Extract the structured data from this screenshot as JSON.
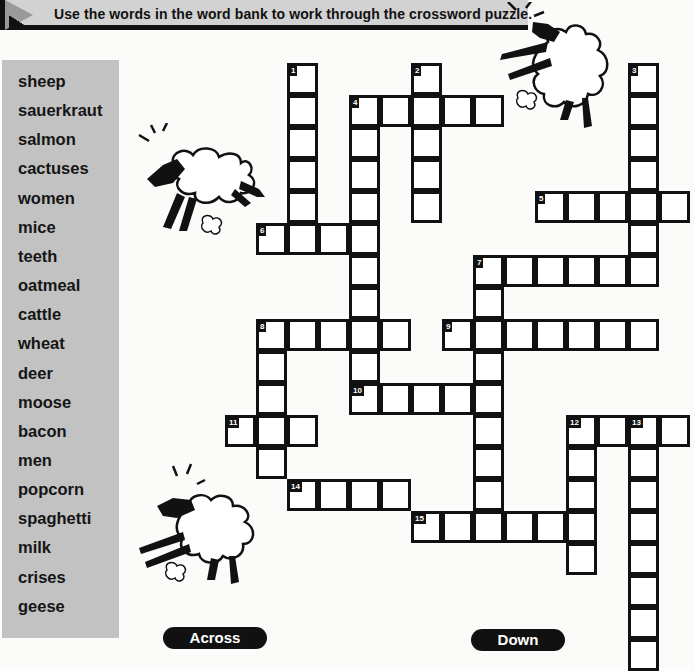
{
  "header": {
    "instruction": "Use the words in the word bank to work through the crossword puzzle."
  },
  "word_bank": {
    "words": [
      "sheep",
      "sauerkraut",
      "salmon",
      "cactuses",
      "women",
      "mice",
      "teeth",
      "oatmeal",
      "cattle",
      "wheat",
      "deer",
      "moose",
      "bacon",
      "men",
      "popcorn",
      "spaghetti",
      "milk",
      "crises",
      "geese"
    ]
  },
  "clue_headers": {
    "across": "Across",
    "down": "Down"
  },
  "crossword": {
    "grid_origin": {
      "x": 257,
      "y": 64,
      "cell_w": 31,
      "cell_h": 32
    },
    "entries": [
      {
        "number": "1",
        "direction": "down",
        "col": 1,
        "row": 0,
        "length": 6
      },
      {
        "number": "2",
        "direction": "down",
        "col": 5,
        "row": 0,
        "length": 5
      },
      {
        "number": "3",
        "direction": "down",
        "col": 12,
        "row": 0,
        "length": 7
      },
      {
        "number": "4",
        "direction": "across",
        "col": 3,
        "row": 1,
        "length": 5
      },
      {
        "number": "4",
        "direction": "down",
        "col": 3,
        "row": 1,
        "length": 10
      },
      {
        "number": "5",
        "direction": "across",
        "col": 9,
        "row": 4,
        "length": 5
      },
      {
        "number": "6",
        "direction": "across",
        "col": 0,
        "row": 5,
        "length": 4
      },
      {
        "number": "7",
        "direction": "across",
        "col": 7,
        "row": 6,
        "length": 6
      },
      {
        "number": "7",
        "direction": "down",
        "col": 7,
        "row": 6,
        "length": 9
      },
      {
        "number": "8",
        "direction": "across",
        "col": 0,
        "row": 8,
        "length": 5
      },
      {
        "number": "8",
        "direction": "down",
        "col": 0,
        "row": 8,
        "length": 5
      },
      {
        "number": "9",
        "direction": "across",
        "col": 6,
        "row": 8,
        "length": 7
      },
      {
        "number": "10",
        "direction": "across",
        "col": 3,
        "row": 10,
        "length": 5
      },
      {
        "number": "11",
        "direction": "across",
        "col": -1,
        "row": 11,
        "length": 3
      },
      {
        "number": "12",
        "direction": "across",
        "col": 10,
        "row": 11,
        "length": 4
      },
      {
        "number": "12",
        "direction": "down",
        "col": 10,
        "row": 11,
        "length": 5
      },
      {
        "number": "13",
        "direction": "down",
        "col": 12,
        "row": 11,
        "length": 8
      },
      {
        "number": "14",
        "direction": "across",
        "col": 1,
        "row": 13,
        "length": 4
      },
      {
        "number": "15",
        "direction": "across",
        "col": 5,
        "row": 14,
        "length": 6
      }
    ]
  },
  "illustrations": [
    "sheep-jumping-top-right",
    "sheep-jumping-left",
    "sheep-jumping-bottom-left"
  ],
  "colors": {
    "banner_bg": "#d2d2d2",
    "wordbank_bg": "#c2c2c2",
    "ink": "#111111",
    "cell_bg": "#ffffff"
  }
}
